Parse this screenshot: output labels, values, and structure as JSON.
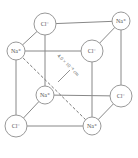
{
  "diagram": {
    "ions": [
      {
        "id": "cl-back-top-left",
        "label": "Cl⁻",
        "x": 45,
        "y": 24,
        "r": 11
      },
      {
        "id": "na-back-top-right",
        "label": "Na⁺",
        "x": 121,
        "y": 21,
        "r": 9
      },
      {
        "id": "na-front-top-left",
        "label": "Na⁺",
        "x": 16,
        "y": 51,
        "r": 9
      },
      {
        "id": "cl-front-top-right",
        "label": "Cl⁻",
        "x": 92,
        "y": 51,
        "r": 11
      },
      {
        "id": "na-back-bottom-left",
        "label": "Na⁺",
        "x": 45,
        "y": 95,
        "r": 9
      },
      {
        "id": "cl-back-bottom-right",
        "label": "Cl⁻",
        "x": 121,
        "y": 96,
        "r": 11
      },
      {
        "id": "cl-front-bottom-left",
        "label": "Cl⁻",
        "x": 16,
        "y": 126,
        "r": 11
      },
      {
        "id": "na-front-bottom-right",
        "label": "Na⁺",
        "x": 92,
        "y": 126,
        "r": 9
      }
    ],
    "distance_label": "4.0 × 10⁻⁸ cm"
  }
}
